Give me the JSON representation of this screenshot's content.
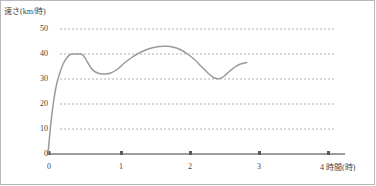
{
  "chart_data": {
    "type": "line",
    "title": "",
    "ylabel": "速さ(km/時)",
    "xlabel": "4 時間(時)",
    "xlim": [
      0,
      4
    ],
    "ylim": [
      0,
      50
    ],
    "grid": true,
    "legend": "none",
    "y_ticks": [
      {
        "value": 50,
        "label": "50"
      },
      {
        "value": 40,
        "label": "40"
      },
      {
        "value": 30,
        "label": "30"
      },
      {
        "value": 20,
        "label": "20"
      },
      {
        "value": 10,
        "label": "10"
      },
      {
        "value": 0,
        "label": "0"
      }
    ],
    "x_ticks": [
      {
        "value": 0,
        "label": "0"
      },
      {
        "value": 1,
        "label": "1"
      },
      {
        "value": 2,
        "label": "2"
      },
      {
        "value": 3,
        "label": "3"
      },
      {
        "value": 4,
        "label": "4"
      }
    ],
    "series": [
      {
        "name": "速さ",
        "color": "#9a9a9a",
        "x": [
          0.0,
          0.04,
          0.08,
          0.12,
          0.17,
          0.22,
          0.28,
          0.33,
          0.38,
          0.44,
          0.5,
          0.56,
          0.62,
          0.68,
          0.75,
          0.82,
          0.9,
          1.0,
          1.1,
          1.2,
          1.3,
          1.4,
          1.5,
          1.6,
          1.7,
          1.8,
          1.9,
          2.0,
          2.1,
          2.2,
          2.3,
          2.38,
          2.45,
          2.52,
          2.6,
          2.68,
          2.76,
          2.85
        ],
        "y": [
          0.0,
          12.0,
          21.0,
          27.5,
          32.5,
          36.2,
          38.8,
          39.9,
          40.0,
          40.0,
          39.6,
          37.0,
          34.3,
          32.8,
          32.1,
          32.0,
          32.4,
          34.0,
          36.5,
          38.6,
          40.3,
          41.6,
          42.5,
          43.0,
          43.1,
          42.7,
          41.7,
          40.0,
          37.8,
          35.0,
          32.2,
          30.5,
          30.1,
          31.0,
          33.0,
          34.8,
          36.0,
          36.6
        ]
      }
    ]
  },
  "axis_colors": {
    "axis": "#7d7d7d",
    "grid": "#b0b0b0",
    "curve": "#9a9a9a"
  }
}
